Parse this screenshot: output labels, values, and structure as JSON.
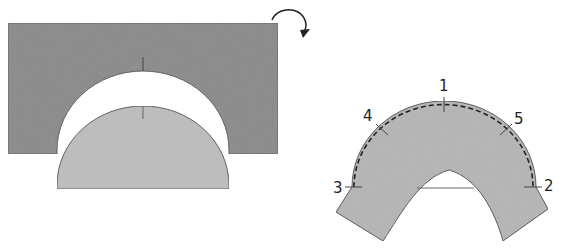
{
  "diagram": {
    "left_panel": {
      "description": "Dark rectangle with semicircular cutout; light half-disc piece below",
      "colors": {
        "rectangle": "#8a8a8a",
        "half_disc": "#bdbdbd",
        "outline": "#555555"
      },
      "rotate_arrow": "clockwise-rotate-arrow"
    },
    "right_panel": {
      "description": "Curved arch piece with dashed seam line and numbered marks",
      "colors": {
        "piece": "#b5b5b5",
        "outline": "#555555",
        "seam": "#222222"
      },
      "labels": [
        {
          "id": "1",
          "text": "1"
        },
        {
          "id": "2",
          "text": "2"
        },
        {
          "id": "3",
          "text": "3"
        },
        {
          "id": "4",
          "text": "4"
        },
        {
          "id": "5",
          "text": "5"
        }
      ]
    }
  }
}
